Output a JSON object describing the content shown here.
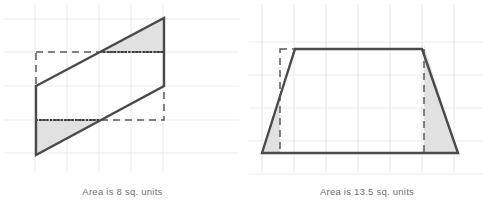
{
  "page": {
    "background": "#ffffff",
    "width": 489,
    "height": 218
  },
  "style": {
    "grid_color": "#e9ebec",
    "outline_color": "#4a4a4a",
    "dashed_color": "#5a5a5a",
    "dotted_color": "#3b3b3b",
    "shade_fill": "#dcdcdc",
    "caption_color": "#6e7174"
  },
  "figures": [
    {
      "id": "parallelogram",
      "name": "left-figure",
      "caption": "Area is 8 sq. units",
      "area_value": "8",
      "area_units": "sq. units",
      "grid": {
        "x_lines": [
          35,
          67,
          99,
          131,
          163
        ],
        "y_lines": [
          19,
          52,
          86,
          120,
          153
        ],
        "cell": 32
      },
      "shape": {
        "type": "parallelogram",
        "points": "36,86 164,18 164,86 36,155",
        "outline_points": "36,86 164,18 164,86 36,155 36,86"
      },
      "dashed_rect": {
        "x": 36,
        "y": 52,
        "width": 128,
        "height": 68
      },
      "dotted_segments": [
        {
          "x1": 100,
          "y1": 52,
          "x2": 164,
          "y2": 52
        },
        {
          "x1": 36,
          "y1": 120,
          "x2": 100,
          "y2": 120
        }
      ],
      "shaded_regions": [
        {
          "name": "upper-triangle",
          "points": "100,52 164,18 164,52"
        },
        {
          "name": "lower-triangle",
          "points": "36,120 100,120 36,155"
        }
      ]
    },
    {
      "id": "trapezoid",
      "name": "right-figure",
      "caption": "Area is  13.5  sq. units",
      "area_value": "13.5",
      "area_units": "sq. units",
      "grid": {
        "x_lines": [
          17,
          49,
          81,
          113,
          145,
          177,
          209
        ],
        "y_lines": [
          42,
          75,
          108,
          141,
          174
        ],
        "cell": 32
      },
      "shape": {
        "type": "trapezoid",
        "points": "17,153 50,49 177,49 213,153",
        "outline_points": "17,153 50,49 177,49 213,153 17,153"
      },
      "dashed_rect": {
        "x": 35,
        "y": 49,
        "width": 144,
        "height": 104
      },
      "dotted_segments": [],
      "shaded_regions": [
        {
          "name": "left-triangle",
          "points": "17,153 35,153 35,96"
        },
        {
          "name": "right-triangle",
          "points": "179,153 213,153 179,45"
        }
      ]
    }
  ]
}
